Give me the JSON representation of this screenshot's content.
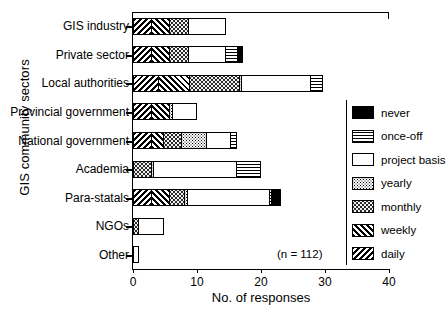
{
  "chart_data": {
    "type": "bar",
    "orientation": "horizontal",
    "stacked": true,
    "title": "",
    "xlabel": "No. of responses",
    "ylabel": "GIS community sectors",
    "xlim": [
      0,
      40
    ],
    "xticks": [
      0,
      10,
      20,
      30,
      40
    ],
    "grid": false,
    "legend_position": "right",
    "annotation": "(n = 112)",
    "categories": [
      "GIS industry",
      "Private sector",
      "Local authorities",
      "Provincial government",
      "National government",
      "Academia",
      "Para-statals",
      "NGOs",
      "Other"
    ],
    "series": [
      {
        "name": "daily",
        "pattern": "p-daily",
        "values": [
          3,
          3,
          4,
          3,
          3,
          0,
          3,
          0,
          0
        ]
      },
      {
        "name": "weekly",
        "pattern": "p-weekly",
        "values": [
          3,
          3,
          5,
          3,
          2,
          0,
          3,
          0,
          0
        ]
      },
      {
        "name": "monthly",
        "pattern": "p-monthly",
        "values": [
          3,
          3,
          8,
          0,
          3,
          3,
          2.5,
          1,
          0
        ]
      },
      {
        "name": "yearly",
        "pattern": "p-yearly",
        "values": [
          0,
          0,
          0.5,
          0.5,
          4,
          0.5,
          0.5,
          0,
          0
        ]
      },
      {
        "name": "project basis",
        "pattern": "p-project",
        "values": [
          6,
          6,
          11,
          4,
          4,
          13,
          13,
          4,
          1
        ]
      },
      {
        "name": "once-off",
        "pattern": "p-onceoff",
        "values": [
          0,
          2,
          2,
          0,
          1,
          4,
          0.5,
          0,
          0
        ]
      },
      {
        "name": "never",
        "pattern": "p-never",
        "values": [
          0,
          1,
          0,
          0,
          0,
          0,
          1.5,
          0,
          0
        ]
      }
    ],
    "totals": [
      15,
      18,
      30.5,
      10.5,
      17,
      20.5,
      24,
      5,
      1
    ]
  },
  "legend": {
    "items": [
      {
        "label": "never",
        "pattern": "p-never"
      },
      {
        "label": "once-off",
        "pattern": "p-onceoff"
      },
      {
        "label": "project basis",
        "pattern": "p-project"
      },
      {
        "label": "yearly",
        "pattern": "p-yearly"
      },
      {
        "label": "monthly",
        "pattern": "p-monthly"
      },
      {
        "label": "weekly",
        "pattern": "p-weekly"
      },
      {
        "label": "daily",
        "pattern": "p-daily"
      }
    ]
  }
}
